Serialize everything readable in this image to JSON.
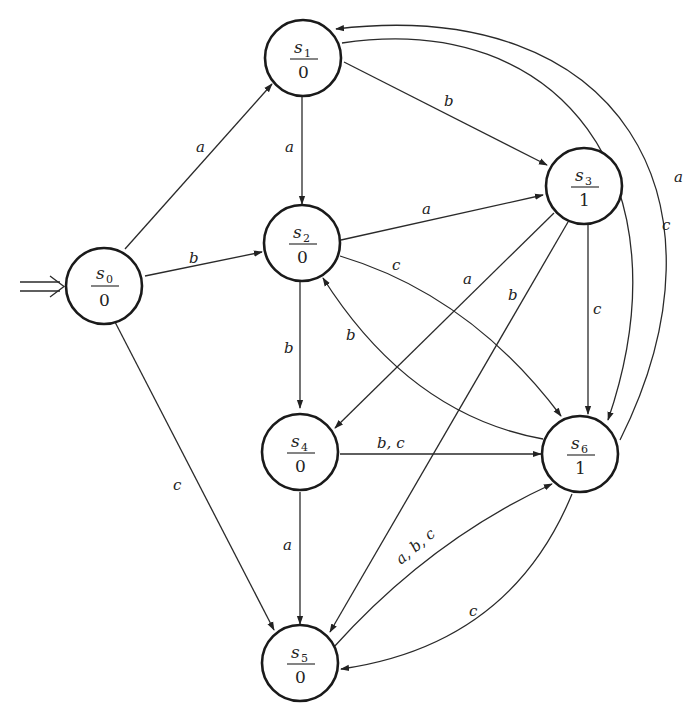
{
  "diagram": {
    "type": "moore-machine-state-diagram",
    "start_state": "s0",
    "states": [
      {
        "id": "s0",
        "name": "s",
        "sub": "0",
        "output": "0"
      },
      {
        "id": "s1",
        "name": "s",
        "sub": "1",
        "output": "0"
      },
      {
        "id": "s2",
        "name": "s",
        "sub": "2",
        "output": "0"
      },
      {
        "id": "s3",
        "name": "s",
        "sub": "3",
        "output": "1"
      },
      {
        "id": "s4",
        "name": "s",
        "sub": "4",
        "output": "0"
      },
      {
        "id": "s5",
        "name": "s",
        "sub": "5",
        "output": "0"
      },
      {
        "id": "s6",
        "name": "s",
        "sub": "6",
        "output": "1"
      }
    ],
    "transitions": [
      {
        "from": "s0",
        "to": "s1",
        "label": "a"
      },
      {
        "from": "s0",
        "to": "s2",
        "label": "b"
      },
      {
        "from": "s0",
        "to": "s5",
        "label": "c"
      },
      {
        "from": "s1",
        "to": "s2",
        "label": "a"
      },
      {
        "from": "s1",
        "to": "s3",
        "label": "b"
      },
      {
        "from": "s1",
        "to": "s6",
        "label": "c"
      },
      {
        "from": "s2",
        "to": "s3",
        "label": "a"
      },
      {
        "from": "s2",
        "to": "s4",
        "label": "b"
      },
      {
        "from": "s2",
        "to": "s6",
        "label": "c"
      },
      {
        "from": "s3",
        "to": "s4",
        "label": "a"
      },
      {
        "from": "s3",
        "to": "s5",
        "label": "b"
      },
      {
        "from": "s3",
        "to": "s6",
        "label": "c"
      },
      {
        "from": "s4",
        "to": "s5",
        "label": "a"
      },
      {
        "from": "s4",
        "to": "s6",
        "label": "b, c"
      },
      {
        "from": "s5",
        "to": "s6",
        "label": "a, b, c"
      },
      {
        "from": "s6",
        "to": "s1",
        "label": "a"
      },
      {
        "from": "s6",
        "to": "s2",
        "label": "b"
      },
      {
        "from": "s6",
        "to": "s5",
        "label": "c"
      }
    ]
  }
}
